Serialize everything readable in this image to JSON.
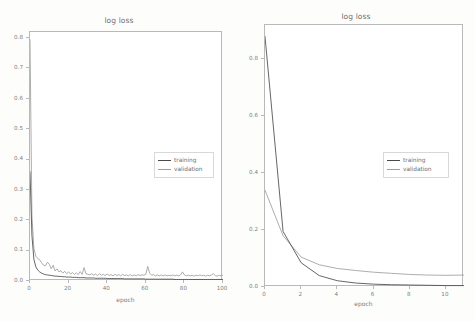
{
  "figure": {
    "background_color": "#fdfdfc",
    "frame_color": "#b9b9b9",
    "training_color": "#4a4a4a",
    "validation_color": "#9e9e9e"
  },
  "charts": [
    {
      "key": "left",
      "title": "log loss",
      "xlabel": "epoch",
      "ylabel": "",
      "xticks": [
        "0",
        "20",
        "40",
        "60",
        "80",
        "100"
      ],
      "yticks": [
        "0.0",
        "0.1",
        "0.2",
        "0.3",
        "0.4",
        "0.5",
        "0.6",
        "0.7",
        "0.8"
      ],
      "legend": [
        {
          "label": "training",
          "color": "#4a4a4a"
        },
        {
          "label": "validation",
          "color": "#9e9e9e"
        }
      ]
    },
    {
      "key": "right",
      "title": "log loss",
      "xlabel": "epoch",
      "ylabel": "",
      "xticks": [
        "0",
        "2",
        "4",
        "6",
        "8",
        "10"
      ],
      "yticks": [
        "0.0",
        "0.2",
        "0.4",
        "0.6",
        "0.8"
      ],
      "legend": [
        {
          "label": "training",
          "color": "#4a4a4a"
        },
        {
          "label": "validation",
          "color": "#9e9e9e"
        }
      ]
    }
  ],
  "chart_data": [
    {
      "type": "line",
      "title": "log loss",
      "xlabel": "epoch",
      "ylabel": "",
      "xlim": [
        0,
        100
      ],
      "ylim": [
        0.0,
        0.82
      ],
      "grid": false,
      "legend_position": "center-right",
      "xticks": [
        0,
        20,
        40,
        60,
        80,
        100
      ],
      "yticks": [
        0.0,
        0.1,
        0.2,
        0.3,
        0.4,
        0.5,
        0.6,
        0.7,
        0.8
      ],
      "x": [
        0,
        1,
        2,
        3,
        4,
        5,
        6,
        7,
        8,
        9,
        10,
        11,
        12,
        13,
        14,
        15,
        16,
        17,
        18,
        19,
        20,
        21,
        22,
        23,
        24,
        25,
        26,
        27,
        28,
        29,
        30,
        31,
        32,
        33,
        34,
        35,
        36,
        37,
        38,
        39,
        40,
        41,
        42,
        43,
        44,
        45,
        46,
        47,
        48,
        49,
        50,
        51,
        52,
        53,
        54,
        55,
        56,
        57,
        58,
        59,
        60,
        61,
        62,
        63,
        64,
        65,
        66,
        67,
        68,
        69,
        70,
        71,
        72,
        73,
        74,
        75,
        76,
        77,
        78,
        79,
        80,
        81,
        82,
        83,
        84,
        85,
        86,
        87,
        88,
        89,
        90,
        91,
        92,
        93,
        94,
        95,
        96,
        97,
        98,
        99,
        100
      ],
      "series": [
        {
          "name": "training",
          "color": "#4a4a4a",
          "values": [
            0.36,
            0.15,
            0.072,
            0.047,
            0.036,
            0.03,
            0.026,
            0.023,
            0.021,
            0.02,
            0.019,
            0.018,
            0.017,
            0.016,
            0.016,
            0.015,
            0.015,
            0.014,
            0.014,
            0.013,
            0.013,
            0.013,
            0.012,
            0.012,
            0.012,
            0.011,
            0.011,
            0.011,
            0.011,
            0.01,
            0.01,
            0.01,
            0.01,
            0.01,
            0.009,
            0.009,
            0.009,
            0.009,
            0.009,
            0.009,
            0.008,
            0.008,
            0.008,
            0.008,
            0.008,
            0.008,
            0.008,
            0.008,
            0.008,
            0.007,
            0.007,
            0.007,
            0.007,
            0.007,
            0.007,
            0.007,
            0.007,
            0.007,
            0.007,
            0.007,
            0.006,
            0.006,
            0.006,
            0.006,
            0.006,
            0.006,
            0.006,
            0.006,
            0.006,
            0.006,
            0.006,
            0.006,
            0.006,
            0.006,
            0.006,
            0.005,
            0.005,
            0.005,
            0.005,
            0.005,
            0.005,
            0.005,
            0.005,
            0.005,
            0.005,
            0.005,
            0.005,
            0.005,
            0.005,
            0.005,
            0.005,
            0.005,
            0.005,
            0.005,
            0.005,
            0.005,
            0.005,
            0.005,
            0.005,
            0.005,
            0.005
          ]
        },
        {
          "name": "validation",
          "color": "#9e9e9e",
          "values": [
            0.795,
            0.215,
            0.108,
            0.082,
            0.074,
            0.07,
            0.06,
            0.052,
            0.05,
            0.062,
            0.055,
            0.04,
            0.052,
            0.033,
            0.04,
            0.03,
            0.034,
            0.026,
            0.032,
            0.024,
            0.03,
            0.023,
            0.028,
            0.022,
            0.027,
            0.021,
            0.031,
            0.022,
            0.044,
            0.024,
            0.022,
            0.02,
            0.024,
            0.019,
            0.023,
            0.018,
            0.024,
            0.019,
            0.022,
            0.018,
            0.023,
            0.018,
            0.021,
            0.017,
            0.022,
            0.018,
            0.021,
            0.017,
            0.022,
            0.018,
            0.02,
            0.017,
            0.021,
            0.017,
            0.02,
            0.017,
            0.021,
            0.018,
            0.02,
            0.019,
            0.022,
            0.048,
            0.026,
            0.019,
            0.021,
            0.017,
            0.02,
            0.017,
            0.02,
            0.017,
            0.02,
            0.017,
            0.019,
            0.017,
            0.02,
            0.017,
            0.019,
            0.017,
            0.02,
            0.03,
            0.02,
            0.017,
            0.019,
            0.017,
            0.019,
            0.016,
            0.019,
            0.017,
            0.02,
            0.017,
            0.019,
            0.016,
            0.019,
            0.017,
            0.02,
            0.024,
            0.018,
            0.016,
            0.019,
            0.017,
            0.019
          ]
        }
      ]
    },
    {
      "type": "line",
      "title": "log loss",
      "xlabel": "epoch",
      "ylabel": "",
      "xlim": [
        0,
        11
      ],
      "ylim": [
        0.0,
        0.92
      ],
      "grid": false,
      "legend_position": "center-right",
      "xticks": [
        0,
        2,
        4,
        6,
        8,
        10
      ],
      "yticks": [
        0.0,
        0.2,
        0.4,
        0.6,
        0.8
      ],
      "x": [
        0,
        1,
        2,
        3,
        4,
        5,
        6,
        7,
        8,
        9,
        10,
        11
      ],
      "series": [
        {
          "name": "training",
          "color": "#4a4a4a",
          "values": [
            0.88,
            0.195,
            0.085,
            0.04,
            0.022,
            0.014,
            0.01,
            0.008,
            0.007,
            0.006,
            0.005,
            0.005
          ]
        },
        {
          "name": "validation",
          "color": "#9e9e9e",
          "values": [
            0.34,
            0.18,
            0.105,
            0.078,
            0.065,
            0.058,
            0.052,
            0.048,
            0.044,
            0.042,
            0.041,
            0.042
          ]
        }
      ]
    }
  ]
}
